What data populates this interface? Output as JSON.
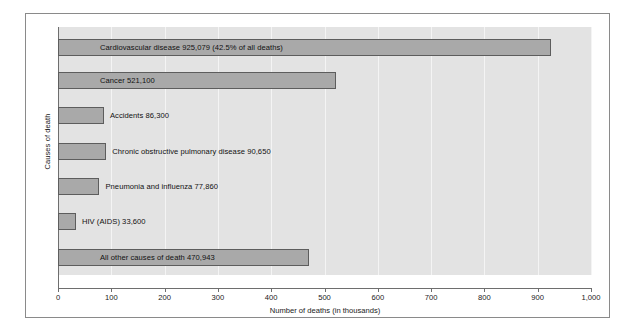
{
  "chart_data": {
    "type": "bar",
    "orientation": "horizontal",
    "title": "",
    "xlabel": "Number of deaths (in thousands)",
    "ylabel": "Causes of death",
    "xlim": [
      0,
      1000
    ],
    "xticks": [
      "0",
      "100",
      "200",
      "300",
      "400",
      "500",
      "600",
      "700",
      "800",
      "900",
      "1,000"
    ],
    "xtick_values": [
      0,
      100,
      200,
      300,
      400,
      500,
      600,
      700,
      800,
      900,
      1000
    ],
    "grid": true,
    "legend": "none",
    "categories": [
      "Cardiovascular disease",
      "Cancer",
      "Accidents",
      "Chronic obstructive pulmonary disease",
      "Pneumonia and influenza",
      "HIV (AIDS)",
      "All other causes of death"
    ],
    "values": [
      925.079,
      521.1,
      86.3,
      90.65,
      77.86,
      33.6,
      470.943
    ],
    "bars": [
      {
        "category": "Cardiovascular disease",
        "value": 925.079,
        "value_label": "925,079",
        "annotation": "(42.5% of all deaths)",
        "label": "Cardiovascular disease   925,079       (42.5% of all deaths)"
      },
      {
        "category": "Cancer",
        "value": 521.1,
        "value_label": "521,100",
        "annotation": "",
        "label": "Cancer   521,100"
      },
      {
        "category": "Accidents",
        "value": 86.3,
        "value_label": "86,300",
        "annotation": "",
        "label": "Accidents   86,300"
      },
      {
        "category": "Chronic obstructive pulmonary disease",
        "value": 90.65,
        "value_label": "90,650",
        "annotation": "",
        "label": "Chronic obstructive pulmonary disease   90,650"
      },
      {
        "category": "Pneumonia and influenza",
        "value": 77.86,
        "value_label": "77,860",
        "annotation": "",
        "label": "Pneumonia and influenza   77,860"
      },
      {
        "category": "HIV (AIDS)",
        "value": 33.6,
        "value_label": "33,600",
        "annotation": "",
        "label": "HIV (AIDS)   33,600"
      },
      {
        "category": "All other causes of death",
        "value": 470.943,
        "value_label": "470,943",
        "annotation": "",
        "label": "All other causes of death   470,943"
      }
    ],
    "colors": {
      "bar_fill": "#a9a9a9",
      "bar_border": "#5d5d5d",
      "plot_background": "#e3e3e3",
      "gridline": "#f4f4f4",
      "axis": "#6e6e6e",
      "frame": "#8a8a8a",
      "text": "#1a1a1a"
    }
  }
}
